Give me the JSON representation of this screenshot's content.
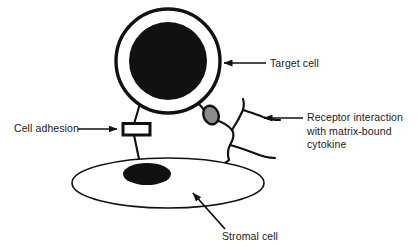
{
  "diagram": {
    "background_color": "#ffffff",
    "ink_color": "#111111",
    "receptor_fill_color": "#8c8c8c",
    "labels": {
      "target_cell": "Target cell",
      "cell_adhesion": "Cell adhesion",
      "receptor_interaction_line1": "Receptor interaction",
      "receptor_interaction_line2": "with matrix-bound",
      "receptor_interaction_line3": "cytokine",
      "stromal_cell": "Stromal cell"
    },
    "shapes": [
      {
        "name": "target-cell",
        "type": "circle",
        "description": "Large round cell with thick black membrane and white cytoplasm",
        "center": [
          168,
          61
        ],
        "radius": 52,
        "fill": "#ffffff",
        "stroke": "#111111"
      },
      {
        "name": "target-cell-nucleus",
        "type": "circle",
        "description": "Solid black nucleus of the target cell",
        "center": [
          168,
          61
        ],
        "radius": 39,
        "fill": "#111111"
      },
      {
        "name": "stromal-cell",
        "type": "ellipse",
        "description": "Wide flat ellipse representing the stromal cell",
        "center": [
          168,
          183
        ],
        "rx": 96,
        "ry": 25,
        "fill": "#ffffff",
        "stroke": "#111111"
      },
      {
        "name": "stromal-cell-nucleus",
        "type": "ellipse",
        "description": "Solid black nucleus of the stromal cell",
        "center": [
          147,
          174
        ],
        "rx": 24,
        "ry": 11,
        "fill": "#111111"
      },
      {
        "name": "adhesion-molecule",
        "type": "rectangle",
        "description": "Cell adhesion molecule bridging target and stromal cell",
        "rect": [
          123,
          124,
          27,
          11
        ],
        "fill": "#ffffff",
        "stroke": "#111111"
      },
      {
        "name": "receptor",
        "type": "ellipse",
        "description": "Gray receptor oval bound to matrix fiber",
        "center": [
          211,
          115
        ],
        "rx": 8,
        "ry": 10,
        "rotation": -25,
        "fill": "#8c8c8c",
        "stroke": "#111111"
      },
      {
        "name": "matrix-fibers",
        "type": "polyline-network",
        "description": "Branching extracellular matrix fibers binding cytokine"
      }
    ],
    "annotation_arrows": [
      {
        "name": "arrow-target-cell",
        "from": [
          266,
          63
        ],
        "to": [
          222,
          63
        ],
        "direction": "left"
      },
      {
        "name": "arrow-cell-adhesion",
        "from": [
          78,
          129
        ],
        "to": [
          119,
          129
        ],
        "direction": "right"
      },
      {
        "name": "arrow-receptor-interaction",
        "from": [
          303,
          118
        ],
        "to": [
          262,
          118
        ],
        "direction": "left"
      },
      {
        "name": "arrow-stromal-cell",
        "from": [
          224,
          228
        ],
        "to": [
          192,
          192
        ],
        "direction": "up-left"
      }
    ]
  }
}
